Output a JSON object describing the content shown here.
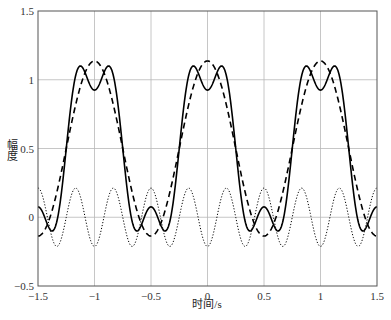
{
  "chart_data": {
    "type": "line",
    "title": "",
    "xlabel": "时间/s",
    "ylabel": "幅度",
    "xlim": [
      -1.5,
      1.5
    ],
    "ylim": [
      -0.5,
      1.5
    ],
    "xticks": [
      -1.5,
      -1,
      -0.5,
      0,
      0.5,
      1,
      1.5
    ],
    "xtick_labels": [
      "−1.5",
      "−1",
      "−0.5",
      "0",
      "0.5",
      "1",
      "1.5"
    ],
    "yticks": [
      -0.5,
      0,
      0.5,
      1,
      1.5
    ],
    "ytick_labels": [
      "−0.5",
      "0",
      "0.5",
      "1",
      "1.5"
    ],
    "grid": true,
    "legend": null,
    "series": [
      {
        "name": "fundamental partial sum",
        "style": "dashed",
        "formula": "0.5 + (2/pi)*cos(2*pi*t)",
        "key_points": {
          "x": [
            -1.5,
            -1,
            -0.75,
            -0.5,
            -0.25,
            0,
            0.25,
            0.5,
            1,
            1.5
          ],
          "y": [
            -0.137,
            1.137,
            0.5,
            -0.137,
            0.5,
            1.137,
            0.5,
            -0.137,
            1.137,
            -0.137
          ]
        }
      },
      {
        "name": "sum through 3rd harmonic",
        "style": "solid",
        "formula": "0.5 + (2/pi)*cos(2*pi*t) - (2/(3*pi))*cos(6*pi*t)",
        "key_points": {
          "x": [
            -1.5,
            -1.11,
            -1,
            -0.89,
            -0.5,
            -0.39,
            0,
            0.11,
            0.5,
            1,
            1.5
          ],
          "y": [
            0.075,
            1.09,
            0.925,
            1.09,
            0.075,
            -0.09,
            0.925,
            1.09,
            0.075,
            0.925,
            0.075
          ]
        }
      },
      {
        "name": "3rd harmonic",
        "style": "dotted",
        "formula": "-(2/(3*pi))*cos(6*pi*t)",
        "key_points": {
          "x": [
            -1.5,
            -1.333,
            -1.167,
            -1,
            -0.5,
            0,
            0.167,
            0.5,
            1,
            1.5
          ],
          "y": [
            0.212,
            -0.212,
            0.212,
            -0.212,
            0.212,
            -0.212,
            0.212,
            0.212,
            -0.212,
            0.212
          ]
        }
      }
    ],
    "colors": {
      "lines": "#000000",
      "grid": "#b8b8b8",
      "axes": "#555555"
    }
  }
}
